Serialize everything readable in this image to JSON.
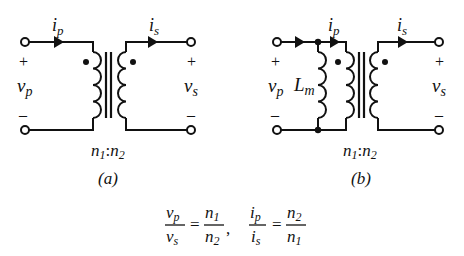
{
  "figure_a": {
    "caption": "(a)",
    "turns_ratio": {
      "n1": "n",
      "n1_sub": "1",
      "sep": ":",
      "n2": "n",
      "n2_sub": "2"
    },
    "primary_current": {
      "sym": "i",
      "sub": "p"
    },
    "secondary_current": {
      "sym": "i",
      "sub": "s"
    },
    "primary_voltage": {
      "sym": "v",
      "sub": "p",
      "plus": "+",
      "minus": "–"
    },
    "secondary_voltage": {
      "sym": "v",
      "sub": "s",
      "plus": "+",
      "minus": "–"
    }
  },
  "figure_b": {
    "caption": "(b)",
    "turns_ratio": {
      "n1": "n",
      "n1_sub": "1",
      "sep": ":",
      "n2": "n",
      "n2_sub": "2"
    },
    "primary_current": {
      "sym": "i",
      "sub": "p"
    },
    "secondary_current": {
      "sym": "i",
      "sub": "s"
    },
    "magnetizing_inductance": {
      "sym": "L",
      "sub": "m"
    },
    "primary_voltage": {
      "sym": "v",
      "sub": "p",
      "plus": "+",
      "minus": "–"
    },
    "secondary_voltage": {
      "sym": "v",
      "sub": "s",
      "plus": "+",
      "minus": "–"
    }
  },
  "equations": {
    "eq1": {
      "lhs_num": {
        "sym": "v",
        "sub": "p"
      },
      "lhs_den": {
        "sym": "v",
        "sub": "s"
      },
      "eq": "=",
      "rhs_num": {
        "sym": "n",
        "sub": "1"
      },
      "rhs_den": {
        "sym": "n",
        "sub": "2"
      },
      "trail": ","
    },
    "eq2": {
      "lhs_num": {
        "sym": "i",
        "sub": "p"
      },
      "lhs_den": {
        "sym": "i",
        "sub": "s"
      },
      "eq": "=",
      "rhs_num": {
        "sym": "n",
        "sub": "2"
      },
      "rhs_den": {
        "sym": "n",
        "sub": "1"
      }
    }
  },
  "colors": {
    "stroke": "#111111",
    "background": "#ffffff"
  }
}
